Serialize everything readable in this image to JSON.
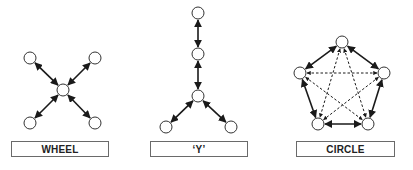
{
  "diagrams": [
    {
      "name": "wheel",
      "label": "WHEEL",
      "nodes": [
        {
          "id": "tl",
          "x": 30,
          "y": 58
        },
        {
          "id": "tr",
          "x": 95,
          "y": 58
        },
        {
          "id": "c",
          "x": 63,
          "y": 90
        },
        {
          "id": "bl",
          "x": 30,
          "y": 123
        },
        {
          "id": "br",
          "x": 95,
          "y": 123
        }
      ],
      "edges": [
        {
          "from": "tl",
          "to": "c",
          "style": "solid",
          "arrows": "both"
        },
        {
          "from": "tr",
          "to": "c",
          "style": "solid",
          "arrows": "both"
        },
        {
          "from": "bl",
          "to": "c",
          "style": "solid",
          "arrows": "both"
        },
        {
          "from": "br",
          "to": "c",
          "style": "solid",
          "arrows": "both"
        }
      ]
    },
    {
      "name": "y",
      "label": "‘Y’",
      "nodes": [
        {
          "id": "top",
          "x": 198,
          "y": 13
        },
        {
          "id": "mid",
          "x": 198,
          "y": 54
        },
        {
          "id": "j",
          "x": 198,
          "y": 96
        },
        {
          "id": "bl",
          "x": 166,
          "y": 127
        },
        {
          "id": "br",
          "x": 231,
          "y": 127
        }
      ],
      "edges": [
        {
          "from": "top",
          "to": "mid",
          "style": "solid",
          "arrows": "both"
        },
        {
          "from": "mid",
          "to": "j",
          "style": "solid",
          "arrows": "both"
        },
        {
          "from": "j",
          "to": "bl",
          "style": "solid",
          "arrows": "both"
        },
        {
          "from": "j",
          "to": "br",
          "style": "solid",
          "arrows": "both"
        }
      ]
    },
    {
      "name": "circle",
      "label": "CIRCLE",
      "nodes": [
        {
          "id": "t",
          "x": 342,
          "y": 42
        },
        {
          "id": "l",
          "x": 300,
          "y": 73
        },
        {
          "id": "r",
          "x": 384,
          "y": 73
        },
        {
          "id": "bl",
          "x": 318,
          "y": 124
        },
        {
          "id": "br",
          "x": 368,
          "y": 124
        }
      ],
      "edges": [
        {
          "from": "t",
          "to": "l",
          "style": "solid",
          "arrows": "both"
        },
        {
          "from": "t",
          "to": "r",
          "style": "solid",
          "arrows": "both"
        },
        {
          "from": "l",
          "to": "bl",
          "style": "solid",
          "arrows": "both"
        },
        {
          "from": "r",
          "to": "br",
          "style": "solid",
          "arrows": "both"
        },
        {
          "from": "bl",
          "to": "br",
          "style": "solid",
          "arrows": "both"
        },
        {
          "from": "l",
          "to": "r",
          "style": "dashed",
          "arrows": "both"
        },
        {
          "from": "t",
          "to": "bl",
          "style": "dashed",
          "arrows": "both"
        },
        {
          "from": "t",
          "to": "br",
          "style": "dashed",
          "arrows": "both"
        },
        {
          "from": "l",
          "to": "br",
          "style": "dashed",
          "arrows": "both"
        },
        {
          "from": "r",
          "to": "bl",
          "style": "dashed",
          "arrows": "both"
        }
      ]
    }
  ],
  "labels": {
    "wheel": "WHEEL",
    "y": "‘Y’",
    "circle": "CIRCLE"
  },
  "style": {
    "line_color": "#1a1a1a",
    "node_radius": 6
  }
}
